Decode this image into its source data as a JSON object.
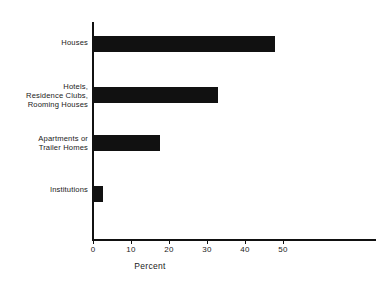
{
  "chart_data": {
    "type": "bar",
    "orientation": "horizontal",
    "title": "",
    "xlabel": "Percent",
    "ylabel": "",
    "categories": [
      "Houses",
      "Hotels,\nResidence Clubs,\nRooming Houses",
      "Apartments or\nTrailer Homes",
      "Institutions"
    ],
    "values": [
      48,
      33,
      17.5,
      2.5
    ],
    "xticks": [
      0,
      10,
      20,
      30,
      40,
      50
    ],
    "xlim": [
      0,
      74
    ],
    "grid": false,
    "legend": false,
    "bar_color": "#111111"
  }
}
